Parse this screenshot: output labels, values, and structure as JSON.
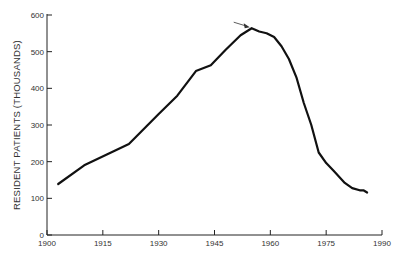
{
  "chart_data": {
    "type": "line",
    "title": "",
    "xlabel": "",
    "ylabel": "RESIDENT PATIENTS (THOUSANDS)",
    "xlim": [
      1900,
      1990
    ],
    "ylim": [
      0,
      600
    ],
    "x_ticks": [
      1900,
      1915,
      1930,
      1945,
      1960,
      1975,
      1990
    ],
    "y_ticks": [
      0,
      100,
      200,
      300,
      400,
      500,
      600
    ],
    "grid": false,
    "legend": null,
    "series": [
      {
        "name": "Resident patients",
        "color": "#111111",
        "x": [
          1903,
          1910,
          1922,
          1930,
          1935,
          1940,
          1944,
          1948,
          1952,
          1955,
          1957,
          1959,
          1961,
          1963,
          1965,
          1967,
          1969,
          1971,
          1973,
          1975,
          1977,
          1980,
          1982,
          1984,
          1985,
          1986
        ],
        "values": [
          139,
          190,
          248,
          330,
          380,
          447,
          463,
          505,
          545,
          564,
          555,
          550,
          540,
          515,
          480,
          430,
          360,
          300,
          225,
          196,
          175,
          142,
          128,
          122,
          122,
          116
        ]
      }
    ],
    "annotations": [
      {
        "type": "arrow",
        "points_to": {
          "x": 1955,
          "y": 564
        },
        "text": ""
      }
    ]
  }
}
